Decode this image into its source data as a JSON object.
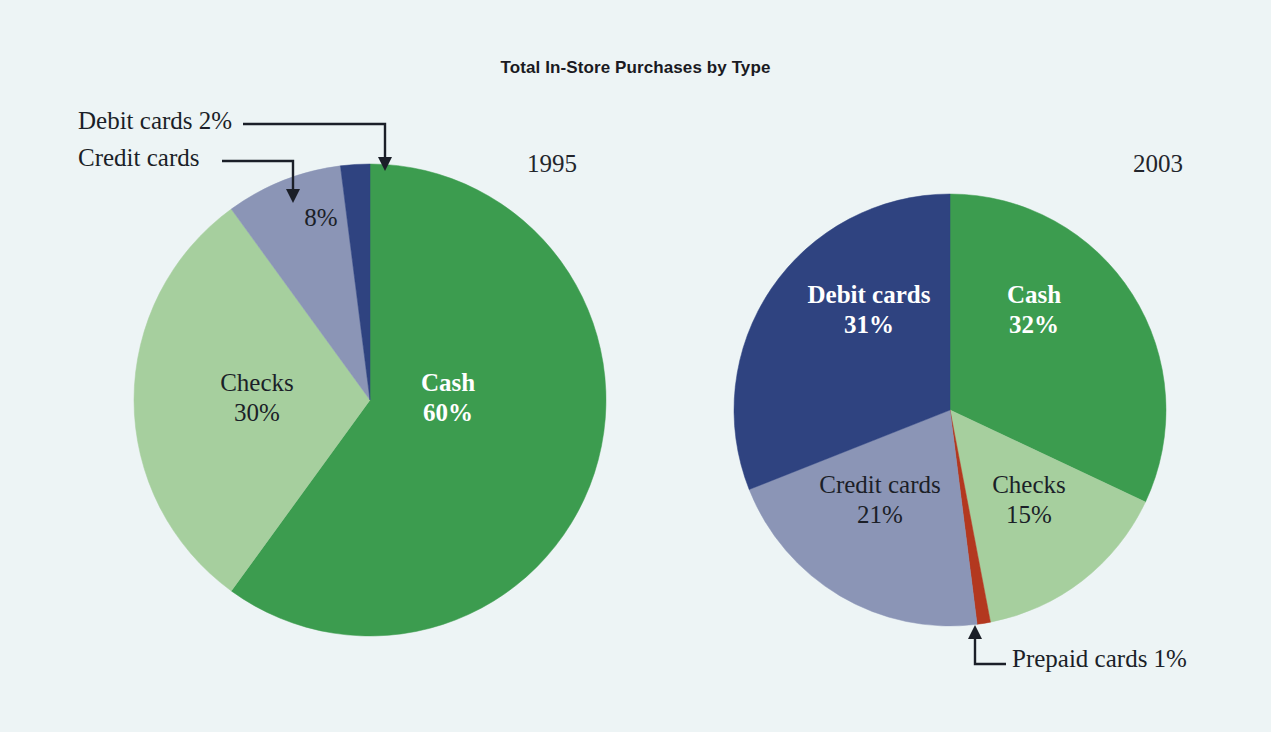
{
  "figure": {
    "title": "Total In-Store Purchases by Type",
    "background_color": "#edf4f5"
  },
  "palette": {
    "cash": "#3c9c4f",
    "checks": "#a6cf9e",
    "credit_cards": "#8b95b6",
    "debit_cards": "#2f4380",
    "prepaid_cards": "#b3381f",
    "text_dark": "#1b1f28",
    "text_light": "#ffffff"
  },
  "charts": [
    {
      "id": "pie-1995",
      "year_label": "1995",
      "cx": 370,
      "cy": 400,
      "r": 236,
      "slices": [
        {
          "name": "Cash",
          "value": 60,
          "color": "#3c9c4f",
          "label_name": "Cash",
          "label_value": "60%",
          "label_style": "light",
          "label_x": 448,
          "label_y": 398,
          "inside": true
        },
        {
          "name": "Checks",
          "value": 30,
          "color": "#a6cf9e",
          "label_name": "Checks",
          "label_value": "30%",
          "label_style": "dark",
          "label_x": 257,
          "label_y": 398,
          "inside": true
        },
        {
          "name": "Credit cards",
          "value": 8,
          "color": "#8b95b6",
          "label_name": "",
          "label_value": "8%",
          "label_style": "dark",
          "label_x": 321,
          "label_y": 218,
          "inside": true
        },
        {
          "name": "Debit cards",
          "value": 2,
          "color": "#2f4380",
          "label_name": "",
          "label_value": "",
          "label_style": "dark",
          "label_x": 0,
          "label_y": 0,
          "inside": false
        }
      ],
      "callouts": [
        {
          "text": "Debit cards 2%",
          "text_x": 78,
          "text_y": 107,
          "line": "M 243 124 L 385 124 L 385 158",
          "arrow_x": 385,
          "arrow_y": 171
        },
        {
          "text": "Credit cards",
          "text_x": 78,
          "text_y": 144,
          "line": "M 222 161 L 293 161 L 293 190",
          "arrow_x": 293,
          "arrow_y": 203
        }
      ]
    },
    {
      "id": "pie-2003",
      "year_label": "2003",
      "cx": 950,
      "cy": 410,
      "r": 216,
      "slices": [
        {
          "name": "Cash",
          "value": 32,
          "color": "#3c9c4f",
          "label_name": "Cash",
          "label_value": "32%",
          "label_style": "light",
          "label_x": 1034,
          "label_y": 310,
          "inside": true
        },
        {
          "name": "Checks",
          "value": 15,
          "color": "#a6cf9e",
          "label_name": "Checks",
          "label_value": "15%",
          "label_style": "dark",
          "label_x": 1029,
          "label_y": 500,
          "inside": true
        },
        {
          "name": "Prepaid cards",
          "value": 1,
          "color": "#b3381f",
          "label_name": "",
          "label_value": "",
          "label_style": "dark",
          "label_x": 0,
          "label_y": 0,
          "inside": false
        },
        {
          "name": "Credit cards",
          "value": 21,
          "color": "#8b95b6",
          "label_name": "Credit cards",
          "label_value": "21%",
          "label_style": "dark",
          "label_x": 880,
          "label_y": 500,
          "inside": true
        },
        {
          "name": "Debit cards",
          "value": 31,
          "color": "#2f4380",
          "label_name": "Debit cards",
          "label_value": "31%",
          "label_style": "light",
          "label_x": 869,
          "label_y": 310,
          "inside": true
        }
      ],
      "callouts": [
        {
          "text": "Prepaid cards 1%",
          "text_x": 1012,
          "text_y": 645,
          "line": "M 1006 664 L 975 664 L 975 638",
          "arrow_x": 975,
          "arrow_y": 625
        }
      ]
    }
  ],
  "chart_data": {
    "type": "pie",
    "title": "Total In-Store Purchases by Type",
    "xlabel": "",
    "ylabel": "",
    "legend_position": "none",
    "units": "percent of total in-store purchases",
    "categories": [
      "Cash",
      "Checks",
      "Credit cards",
      "Debit cards",
      "Prepaid cards"
    ],
    "series": [
      {
        "name": "1995",
        "values": [
          60,
          30,
          8,
          2,
          0
        ]
      },
      {
        "name": "2003",
        "values": [
          32,
          15,
          21,
          31,
          1
        ]
      }
    ],
    "pies": [
      {
        "name": "1995",
        "labels": [
          "Cash",
          "Checks",
          "Credit cards",
          "Debit cards"
        ],
        "values": [
          60,
          30,
          8,
          2
        ],
        "colors": [
          "#3c9c4f",
          "#a6cf9e",
          "#8b95b6",
          "#2f4380"
        ],
        "data_labels": [
          "Cash 60%",
          "Checks 30%",
          "8%",
          "Debit cards 2%"
        ],
        "annotations": [
          "Debit cards 2%",
          "Credit cards"
        ]
      },
      {
        "name": "2003",
        "labels": [
          "Cash",
          "Checks",
          "Prepaid cards",
          "Credit cards",
          "Debit cards"
        ],
        "values": [
          32,
          15,
          1,
          21,
          31
        ],
        "colors": [
          "#3c9c4f",
          "#a6cf9e",
          "#b3381f",
          "#8b95b6",
          "#2f4380"
        ],
        "data_labels": [
          "Cash 32%",
          "Checks 15%",
          "Prepaid cards 1%",
          "Credit cards 21%",
          "Debit cards 31%"
        ],
        "annotations": [
          "Prepaid cards 1%"
        ]
      }
    ]
  }
}
